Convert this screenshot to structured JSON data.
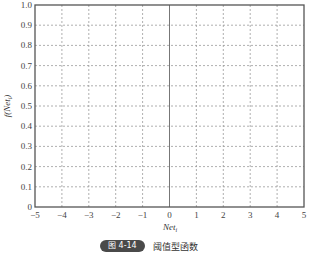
{
  "chart_data": {
    "type": "line",
    "title": "",
    "xlabel": "Net_i",
    "ylabel": "f(Net_i)",
    "xlim": [
      -5,
      5
    ],
    "ylim": [
      0,
      1.0
    ],
    "x_ticks": [
      "-5",
      "-4",
      "-3",
      "-2",
      "-1",
      "0",
      "1",
      "2",
      "3",
      "4",
      "5"
    ],
    "y_ticks": [
      "0",
      "0.1",
      "0.2",
      "0.3",
      "0.4",
      "0.5",
      "0.6",
      "0.7",
      "0.8",
      "0.9",
      "1.0"
    ],
    "grid": true,
    "grid_style": "dashed",
    "series": [],
    "annotations": [
      "solid vertical line at x=0"
    ],
    "legend": null
  },
  "axes": {
    "xlabel_main": "Net",
    "xlabel_sub": "i",
    "ylabel_main": "f(Net",
    "ylabel_sub": "i",
    "ylabel_close": ")"
  },
  "caption": {
    "badge": "图 4-14",
    "text": "阈值型函数"
  },
  "colors": {
    "frame": "#555555",
    "grid": "#9a9a9a",
    "badge_bg": "#4a4a4a"
  }
}
